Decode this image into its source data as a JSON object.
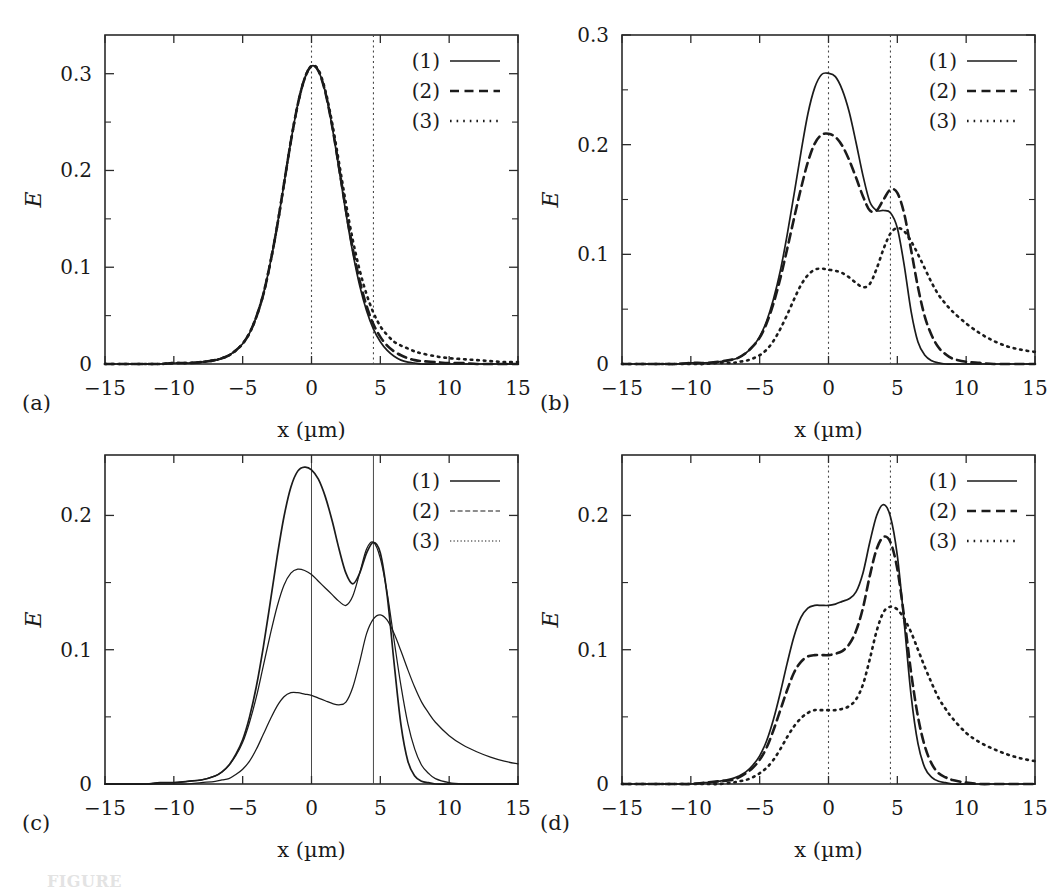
{
  "figure": {
    "panel_tags": [
      "(a)",
      "(b)",
      "(c)",
      "(d)"
    ],
    "caption_partial": "FIGURE",
    "colors": {
      "ink": "#1b1b1b",
      "frame": "#2b2b2b",
      "guide": "#4a4a4a",
      "background": "#ffffff"
    }
  },
  "chart_data": [
    {
      "panel": "(a)",
      "type": "line",
      "title": "",
      "xlabel": "x (µm)",
      "ylabel": "E",
      "xlim": [
        -15,
        15
      ],
      "ylim": [
        0,
        0.34
      ],
      "xticks": [
        -15,
        -10,
        -5,
        0,
        5,
        10,
        15
      ],
      "xticklabels": [
        "−15",
        "−10",
        "−5",
        "0",
        "5",
        "10",
        "15"
      ],
      "yticks": [
        0,
        0.1,
        0.2,
        0.3
      ],
      "yticklabels": [
        "0",
        "0.1",
        "0.2",
        "0.3"
      ],
      "yticks_minor": [
        0.05,
        0.15,
        0.25
      ],
      "grid": false,
      "legend_position": "top-right",
      "vlines": [
        0,
        4.5
      ],
      "vline_style": "dotted",
      "x": [
        -15,
        -14,
        -13,
        -12,
        -11,
        -10,
        -9,
        -8,
        -7,
        -6.5,
        -6,
        -5.5,
        -5,
        -4.5,
        -4,
        -3.5,
        -3,
        -2.5,
        -2,
        -1.5,
        -1,
        -0.5,
        0,
        0.5,
        1,
        1.5,
        2,
        2.5,
        3,
        3.5,
        4,
        4.5,
        5,
        5.5,
        6,
        6.5,
        7,
        7.5,
        8,
        9,
        10,
        11,
        12,
        13,
        14,
        15
      ],
      "series": [
        {
          "name": "(1)",
          "style": "solid",
          "values": [
            0.0,
            0.0,
            0.0,
            0.0,
            0.0,
            0.001,
            0.001,
            0.002,
            0.004,
            0.006,
            0.009,
            0.014,
            0.021,
            0.032,
            0.049,
            0.072,
            0.104,
            0.142,
            0.186,
            0.23,
            0.268,
            0.295,
            0.308,
            0.303,
            0.281,
            0.245,
            0.201,
            0.156,
            0.115,
            0.081,
            0.055,
            0.036,
            0.023,
            0.014,
            0.008,
            0.004,
            0.002,
            0.001,
            0.0,
            0.0,
            0.0,
            0.0,
            0.0,
            0.0,
            0.0,
            0.0
          ]
        },
        {
          "name": "(2)",
          "style": "dashed",
          "values": [
            0.0,
            0.0,
            0.0,
            0.0,
            0.0,
            0.001,
            0.001,
            0.002,
            0.004,
            0.006,
            0.009,
            0.014,
            0.021,
            0.032,
            0.049,
            0.072,
            0.104,
            0.142,
            0.186,
            0.23,
            0.268,
            0.295,
            0.308,
            0.303,
            0.281,
            0.246,
            0.203,
            0.159,
            0.119,
            0.086,
            0.06,
            0.041,
            0.028,
            0.019,
            0.013,
            0.009,
            0.006,
            0.004,
            0.003,
            0.002,
            0.001,
            0.001,
            0.0,
            0.0,
            0.0,
            0.0
          ]
        },
        {
          "name": "(3)",
          "style": "dotted",
          "values": [
            0.0,
            0.0,
            0.0,
            0.0,
            0.0,
            0.001,
            0.001,
            0.002,
            0.004,
            0.006,
            0.009,
            0.014,
            0.021,
            0.032,
            0.049,
            0.072,
            0.104,
            0.142,
            0.186,
            0.23,
            0.268,
            0.295,
            0.308,
            0.304,
            0.283,
            0.249,
            0.208,
            0.166,
            0.128,
            0.097,
            0.072,
            0.053,
            0.039,
            0.03,
            0.023,
            0.019,
            0.016,
            0.013,
            0.011,
            0.008,
            0.006,
            0.005,
            0.004,
            0.003,
            0.002,
            0.002
          ]
        }
      ]
    },
    {
      "panel": "(b)",
      "type": "line",
      "title": "",
      "xlabel": "x (µm)",
      "ylabel": "E",
      "xlim": [
        -15,
        15
      ],
      "ylim": [
        0,
        0.3
      ],
      "xticks": [
        -15,
        -10,
        -5,
        0,
        5,
        10,
        15
      ],
      "xticklabels": [
        "−15",
        "−10",
        "−5",
        "0",
        "5",
        "10",
        "15"
      ],
      "yticks": [
        0,
        0.1,
        0.2,
        0.3
      ],
      "yticklabels": [
        "0",
        "0.1",
        "0.2",
        "0.3"
      ],
      "yticks_minor": [
        0.05,
        0.15,
        0.25
      ],
      "grid": false,
      "legend_position": "top-right",
      "vlines": [
        0,
        4.5
      ],
      "vline_style": "dotted",
      "x": [
        -15,
        -14,
        -13,
        -12,
        -11,
        -10,
        -9,
        -8,
        -7,
        -6.5,
        -6,
        -5.5,
        -5,
        -4.5,
        -4,
        -3.5,
        -3,
        -2.5,
        -2,
        -1.5,
        -1,
        -0.5,
        0,
        0.5,
        1,
        1.5,
        2,
        2.5,
        3,
        3.5,
        4,
        4.5,
        5,
        5.5,
        6,
        6.5,
        7,
        7.5,
        8,
        8.5,
        9,
        10,
        11,
        12,
        13,
        14,
        15
      ],
      "series": [
        {
          "name": "(1)",
          "style": "solid",
          "values": [
            0.0,
            0.0,
            0.0,
            0.0,
            0.0,
            0.001,
            0.001,
            0.002,
            0.004,
            0.006,
            0.01,
            0.016,
            0.025,
            0.039,
            0.059,
            0.085,
            0.118,
            0.155,
            0.193,
            0.228,
            0.252,
            0.264,
            0.265,
            0.262,
            0.25,
            0.23,
            0.202,
            0.172,
            0.148,
            0.14,
            0.14,
            0.138,
            0.124,
            0.09,
            0.048,
            0.02,
            0.008,
            0.003,
            0.001,
            0.0,
            0.0,
            0.0,
            0.0,
            0.0,
            0.0,
            0.0,
            0.0
          ]
        },
        {
          "name": "(2)",
          "style": "dashed",
          "values": [
            0.0,
            0.0,
            0.0,
            0.0,
            0.0,
            0.001,
            0.001,
            0.002,
            0.004,
            0.006,
            0.01,
            0.016,
            0.024,
            0.037,
            0.055,
            0.078,
            0.105,
            0.133,
            0.16,
            0.184,
            0.201,
            0.209,
            0.21,
            0.207,
            0.199,
            0.186,
            0.17,
            0.153,
            0.14,
            0.14,
            0.15,
            0.159,
            0.156,
            0.137,
            0.104,
            0.07,
            0.043,
            0.026,
            0.015,
            0.009,
            0.005,
            0.002,
            0.001,
            0.0,
            0.0,
            0.0,
            0.0
          ]
        },
        {
          "name": "(3)",
          "style": "dotted",
          "values": [
            0.0,
            0.0,
            0.0,
            0.0,
            0.0,
            0.0,
            0.0,
            0.001,
            0.001,
            0.002,
            0.003,
            0.005,
            0.008,
            0.013,
            0.021,
            0.032,
            0.045,
            0.059,
            0.072,
            0.081,
            0.086,
            0.087,
            0.086,
            0.085,
            0.083,
            0.079,
            0.074,
            0.07,
            0.073,
            0.087,
            0.105,
            0.119,
            0.124,
            0.121,
            0.112,
            0.1,
            0.087,
            0.074,
            0.063,
            0.055,
            0.048,
            0.037,
            0.028,
            0.021,
            0.016,
            0.013,
            0.011
          ]
        }
      ]
    },
    {
      "panel": "(c)",
      "type": "line",
      "title": "",
      "xlabel": "x (µm)",
      "ylabel": "E",
      "xlim": [
        -15,
        15
      ],
      "ylim": [
        0,
        0.245
      ],
      "xticks": [
        -15,
        -10,
        -5,
        0,
        5,
        10,
        15
      ],
      "xticklabels": [
        "−15",
        "−10",
        "−5",
        "0",
        "5",
        "10",
        "15"
      ],
      "yticks": [
        0,
        0.1,
        0.2
      ],
      "yticklabels": [
        "0",
        "0.1",
        "0.2"
      ],
      "yticks_minor": [
        0.05,
        0.15
      ],
      "grid": false,
      "legend_position": "top-right",
      "vlines": [
        0,
        4.5
      ],
      "vline_style": "solid",
      "x": [
        -15,
        -14,
        -13,
        -12,
        -11,
        -10,
        -9,
        -8,
        -7,
        -6.5,
        -6,
        -5.5,
        -5,
        -4.5,
        -4,
        -3.5,
        -3,
        -2.5,
        -2,
        -1.5,
        -1,
        -0.5,
        0,
        0.5,
        1,
        1.5,
        2,
        2.5,
        3,
        3.5,
        4,
        4.5,
        5,
        5.5,
        6,
        6.5,
        7,
        7.5,
        8,
        8.5,
        9,
        10,
        11,
        12,
        13,
        14,
        15
      ],
      "series": [
        {
          "name": "(1)",
          "style": "solid",
          "values": [
            0.0,
            0.0,
            0.0,
            0.0,
            0.001,
            0.001,
            0.002,
            0.003,
            0.006,
            0.009,
            0.014,
            0.022,
            0.033,
            0.05,
            0.073,
            0.102,
            0.135,
            0.169,
            0.199,
            0.221,
            0.233,
            0.236,
            0.234,
            0.227,
            0.214,
            0.196,
            0.175,
            0.157,
            0.149,
            0.157,
            0.172,
            0.18,
            0.172,
            0.14,
            0.09,
            0.044,
            0.017,
            0.006,
            0.002,
            0.001,
            0.0,
            0.0,
            0.0,
            0.0,
            0.0,
            0.0,
            0.0
          ]
        },
        {
          "name": "(2)",
          "style": "dashed-thin",
          "values": [
            0.0,
            0.0,
            0.0,
            0.0,
            0.001,
            0.001,
            0.002,
            0.003,
            0.006,
            0.009,
            0.014,
            0.021,
            0.031,
            0.046,
            0.065,
            0.088,
            0.111,
            0.132,
            0.148,
            0.157,
            0.16,
            0.159,
            0.156,
            0.151,
            0.146,
            0.141,
            0.136,
            0.133,
            0.14,
            0.157,
            0.175,
            0.18,
            0.168,
            0.142,
            0.107,
            0.073,
            0.045,
            0.026,
            0.014,
            0.008,
            0.004,
            0.001,
            0.0,
            0.0,
            0.0,
            0.0,
            0.0
          ]
        },
        {
          "name": "(3)",
          "style": "dotted-thin",
          "values": [
            0.0,
            0.0,
            0.0,
            0.0,
            0.0,
            0.0,
            0.0,
            0.001,
            0.002,
            0.003,
            0.004,
            0.007,
            0.011,
            0.017,
            0.026,
            0.037,
            0.048,
            0.058,
            0.065,
            0.068,
            0.068,
            0.067,
            0.066,
            0.064,
            0.062,
            0.06,
            0.059,
            0.061,
            0.072,
            0.091,
            0.112,
            0.123,
            0.126,
            0.122,
            0.112,
            0.099,
            0.085,
            0.072,
            0.061,
            0.053,
            0.046,
            0.036,
            0.029,
            0.024,
            0.02,
            0.017,
            0.015
          ]
        }
      ]
    },
    {
      "panel": "(d)",
      "type": "line",
      "title": "",
      "xlabel": "x (µm)",
      "ylabel": "E",
      "xlim": [
        -15,
        15
      ],
      "ylim": [
        0,
        0.245
      ],
      "xticks": [
        -15,
        -10,
        -5,
        0,
        5,
        10,
        15
      ],
      "xticklabels": [
        "−15",
        "−10",
        "−5",
        "0",
        "5",
        "10",
        "15"
      ],
      "yticks": [
        0,
        0.1,
        0.2
      ],
      "yticklabels": [
        "0",
        "0.1",
        "0.2"
      ],
      "yticks_minor": [
        0.05,
        0.15
      ],
      "grid": false,
      "legend_position": "top-right",
      "vlines": [
        0,
        4.5
      ],
      "vline_style": "dotted",
      "x": [
        -15,
        -14,
        -13,
        -12,
        -11,
        -10,
        -9,
        -8,
        -7,
        -6.5,
        -6,
        -5.5,
        -5,
        -4.5,
        -4,
        -3.5,
        -3,
        -2.5,
        -2,
        -1.5,
        -1,
        -0.5,
        0,
        0.5,
        1,
        1.5,
        2,
        2.5,
        3,
        3.5,
        4,
        4.5,
        5,
        5.5,
        6,
        6.5,
        7,
        7.5,
        8,
        8.5,
        9,
        10,
        11,
        12,
        13,
        14,
        15
      ],
      "series": [
        {
          "name": "(1)",
          "style": "solid",
          "values": [
            0.0,
            0.0,
            0.0,
            0.0,
            0.0,
            0.0,
            0.001,
            0.002,
            0.004,
            0.006,
            0.009,
            0.014,
            0.021,
            0.032,
            0.048,
            0.068,
            0.09,
            0.11,
            0.124,
            0.131,
            0.133,
            0.133,
            0.133,
            0.134,
            0.136,
            0.138,
            0.143,
            0.157,
            0.18,
            0.2,
            0.208,
            0.199,
            0.17,
            0.12,
            0.066,
            0.03,
            0.012,
            0.005,
            0.002,
            0.001,
            0.0,
            0.0,
            0.0,
            0.0,
            0.0,
            0.0,
            0.0
          ]
        },
        {
          "name": "(2)",
          "style": "dashed",
          "values": [
            0.0,
            0.0,
            0.0,
            0.0,
            0.0,
            0.0,
            0.001,
            0.002,
            0.003,
            0.005,
            0.008,
            0.012,
            0.018,
            0.027,
            0.04,
            0.055,
            0.07,
            0.083,
            0.091,
            0.095,
            0.096,
            0.096,
            0.096,
            0.097,
            0.099,
            0.104,
            0.114,
            0.131,
            0.155,
            0.175,
            0.184,
            0.18,
            0.16,
            0.124,
            0.083,
            0.05,
            0.028,
            0.015,
            0.008,
            0.005,
            0.003,
            0.001,
            0.0,
            0.0,
            0.0,
            0.0,
            0.0
          ]
        },
        {
          "name": "(3)",
          "style": "dotted",
          "values": [
            0.0,
            0.0,
            0.0,
            0.0,
            0.0,
            0.0,
            0.0,
            0.0,
            0.001,
            0.002,
            0.003,
            0.005,
            0.008,
            0.012,
            0.018,
            0.026,
            0.035,
            0.043,
            0.049,
            0.053,
            0.055,
            0.055,
            0.055,
            0.055,
            0.056,
            0.058,
            0.063,
            0.074,
            0.093,
            0.114,
            0.128,
            0.132,
            0.13,
            0.123,
            0.113,
            0.1,
            0.087,
            0.075,
            0.064,
            0.056,
            0.049,
            0.038,
            0.031,
            0.026,
            0.022,
            0.019,
            0.017
          ]
        }
      ]
    }
  ]
}
